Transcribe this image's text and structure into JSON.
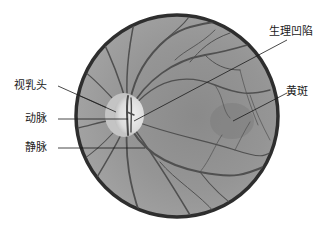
{
  "diagram": {
    "colors": {
      "background": "#ffffff",
      "fundus": "#8f8f8f",
      "fundus_light": "#a4a4a4",
      "border": "#2e2e2e",
      "vessel": "#505050",
      "optic_disc": "#e6e6e6",
      "optic_rim": "#c8c8c8",
      "leader_line": "#1a1a1a",
      "text": "#1a1a1a"
    },
    "fundus_circle": {
      "cx": 177,
      "cy": 116,
      "r": 101
    },
    "optic_disc": {
      "cx": 126,
      "cy": 115,
      "rx": 17,
      "ry": 20
    },
    "labels": [
      {
        "id": "optic-papilla",
        "text": "视乳头",
        "x": 14,
        "y": 80,
        "line": [
          58,
          86,
          116,
          112
        ]
      },
      {
        "id": "artery",
        "text": "动脉",
        "x": 25,
        "y": 113,
        "line": [
          58,
          119,
          128,
          119
        ]
      },
      {
        "id": "vein",
        "text": "静脉",
        "x": 25,
        "y": 142,
        "line": [
          58,
          148,
          145,
          148
        ]
      },
      {
        "id": "physiologic-cup",
        "text": "生理凹陷",
        "x": 269,
        "y": 26,
        "line": [
          287,
          40,
          134,
          121
        ]
      },
      {
        "id": "macula",
        "text": "黄斑",
        "x": 285,
        "y": 86,
        "line": [
          287,
          93,
          233,
          121
        ]
      }
    ]
  }
}
